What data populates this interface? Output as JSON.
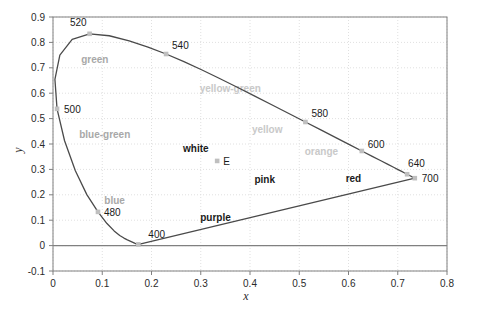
{
  "chart_data": {
    "type": "line",
    "title": "",
    "xlabel": "x",
    "ylabel": "y",
    "xlim": [
      0,
      0.8
    ],
    "ylim": [
      -0.1,
      0.9
    ],
    "grid": true,
    "legend_position": "none",
    "x_ticks": [
      "0",
      "0.1",
      "0.2",
      "0.3",
      "0.4",
      "0.5",
      "0.6",
      "0.7",
      "0.8"
    ],
    "x_tick_values": [
      0,
      0.1,
      0.2,
      0.3,
      0.4,
      0.5,
      0.6,
      0.7,
      0.8
    ],
    "y_ticks": [
      "-0.1",
      "0",
      "0.1",
      "0.2",
      "0.3",
      "0.4",
      "0.5",
      "0.6",
      "0.7",
      "0.8",
      "0.9"
    ],
    "y_tick_values": [
      -0.1,
      0,
      0.1,
      0.2,
      0.3,
      0.4,
      0.5,
      0.6,
      0.7,
      0.8,
      0.9
    ],
    "series": [
      {
        "name": "spectral-locus",
        "points": [
          [
            0.1741,
            0.005
          ],
          [
            0.174,
            0.005
          ],
          [
            0.1738,
            0.0049
          ],
          [
            0.1736,
            0.0049
          ],
          [
            0.1733,
            0.0048
          ],
          [
            0.173,
            0.0048
          ],
          [
            0.1726,
            0.0048
          ],
          [
            0.1721,
            0.0048
          ],
          [
            0.1714,
            0.0051
          ],
          [
            0.1703,
            0.0058
          ],
          [
            0.1689,
            0.0069
          ],
          [
            0.1669,
            0.0086
          ],
          [
            0.1644,
            0.0109
          ],
          [
            0.1611,
            0.0138
          ],
          [
            0.1566,
            0.0177
          ],
          [
            0.151,
            0.0227
          ],
          [
            0.144,
            0.0297
          ],
          [
            0.1355,
            0.0399
          ],
          [
            0.1241,
            0.0578
          ],
          [
            0.1096,
            0.0868
          ],
          [
            0.0913,
            0.1327
          ],
          [
            0.0687,
            0.2007
          ],
          [
            0.0454,
            0.295
          ],
          [
            0.0235,
            0.4127
          ],
          [
            0.0082,
            0.5384
          ],
          [
            0.0039,
            0.6548
          ],
          [
            0.0139,
            0.7502
          ],
          [
            0.0389,
            0.812
          ],
          [
            0.0743,
            0.8338
          ],
          [
            0.1142,
            0.8262
          ],
          [
            0.1547,
            0.8059
          ],
          [
            0.1929,
            0.7816
          ],
          [
            0.2296,
            0.7543
          ],
          [
            0.2658,
            0.7243
          ],
          [
            0.3016,
            0.6923
          ],
          [
            0.3373,
            0.6589
          ],
          [
            0.3731,
            0.6245
          ],
          [
            0.4087,
            0.5896
          ],
          [
            0.4441,
            0.5547
          ],
          [
            0.4788,
            0.5202
          ],
          [
            0.5125,
            0.4866
          ],
          [
            0.5448,
            0.4544
          ],
          [
            0.5752,
            0.4242
          ],
          [
            0.6029,
            0.3965
          ],
          [
            0.627,
            0.3725
          ],
          [
            0.6482,
            0.3514
          ],
          [
            0.6658,
            0.334
          ],
          [
            0.6801,
            0.3197
          ],
          [
            0.6915,
            0.3083
          ],
          [
            0.7006,
            0.2993
          ],
          [
            0.7079,
            0.292
          ],
          [
            0.714,
            0.2859
          ],
          [
            0.719,
            0.2809
          ],
          [
            0.723,
            0.277
          ],
          [
            0.726,
            0.274
          ],
          [
            0.7283,
            0.2717
          ],
          [
            0.73,
            0.27
          ],
          [
            0.7311,
            0.2689
          ],
          [
            0.732,
            0.268
          ],
          [
            0.7327,
            0.2673
          ],
          [
            0.7334,
            0.2666
          ],
          [
            0.734,
            0.266
          ],
          [
            0.7344,
            0.2656
          ],
          [
            0.7346,
            0.2654
          ]
        ]
      },
      {
        "name": "purple-line",
        "points": [
          [
            0.1741,
            0.005
          ],
          [
            0.7346,
            0.2654
          ]
        ]
      }
    ],
    "markers": [
      {
        "label": "400",
        "x": 0.1733,
        "y": 0.0048,
        "label_dx": 10,
        "label_dy": -6
      },
      {
        "label": "480",
        "x": 0.0913,
        "y": 0.1327,
        "label_dx": 6,
        "label_dy": 4
      },
      {
        "label": "500",
        "x": 0.0082,
        "y": 0.5384,
        "label_dx": 7,
        "label_dy": 4
      },
      {
        "label": "520",
        "x": 0.0743,
        "y": 0.8338,
        "label_dx": -3,
        "label_dy": -8
      },
      {
        "label": "540",
        "x": 0.2296,
        "y": 0.7543,
        "label_dx": 6,
        "label_dy": -5
      },
      {
        "label": "580",
        "x": 0.5125,
        "y": 0.4866,
        "label_dx": 6,
        "label_dy": -5
      },
      {
        "label": "600",
        "x": 0.627,
        "y": 0.3725,
        "label_dx": 6,
        "label_dy": -3
      },
      {
        "label": "640",
        "x": 0.719,
        "y": 0.2809,
        "label_dx": 1,
        "label_dy": -7
      },
      {
        "label": "700",
        "x": 0.7346,
        "y": 0.2654,
        "label_dx": 7,
        "label_dy": 4
      }
    ],
    "white_point": {
      "label": "E",
      "x": 0.3333,
      "y": 0.3333
    },
    "region_labels": [
      {
        "text": "green",
        "x": 0.085,
        "y": 0.72,
        "style": "mid"
      },
      {
        "text": "blue-green",
        "x": 0.105,
        "y": 0.425,
        "style": "mid"
      },
      {
        "text": "blue",
        "x": 0.125,
        "y": 0.165,
        "style": "mid"
      },
      {
        "text": "purple",
        "x": 0.33,
        "y": 0.095,
        "style": "strong"
      },
      {
        "text": "white",
        "x": 0.29,
        "y": 0.37,
        "style": "strong"
      },
      {
        "text": "pink",
        "x": 0.43,
        "y": 0.245,
        "style": "strong"
      },
      {
        "text": "red",
        "x": 0.61,
        "y": 0.25,
        "style": "strong"
      },
      {
        "text": "orange",
        "x": 0.545,
        "y": 0.355,
        "style": "faint"
      },
      {
        "text": "yellow",
        "x": 0.435,
        "y": 0.445,
        "style": "faint"
      },
      {
        "text": "yellow-green",
        "x": 0.36,
        "y": 0.605,
        "style": "faint"
      }
    ],
    "colors": {
      "curve": "#4a4a4a",
      "axis": "#808080",
      "grid": "#e0e0e0",
      "marker": "#bfbfbf",
      "text": "#2b2b2b",
      "faint_text": "#c9c9c9",
      "mid_text": "#a8a8a8",
      "background": "#ffffff"
    }
  }
}
